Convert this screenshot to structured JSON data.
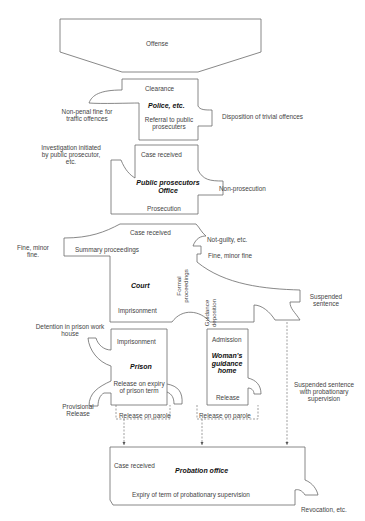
{
  "diagram": {
    "nodes": {
      "offense": {
        "label": "Offense"
      },
      "police": {
        "title": "Police, etc.",
        "top": "Clearance",
        "bottom": "Referral to public prosecuters"
      },
      "prosecutor": {
        "title": "Public prosecutors Office",
        "top": "Case received",
        "bottom": "Prosecution"
      },
      "court": {
        "title": "Court",
        "top": "Case received",
        "summary": "Summary proceedings",
        "formal": "Formal proceedings",
        "guidance": "Guidance deposition",
        "imprisonment": "Imprisonment"
      },
      "prison": {
        "title": "Prison",
        "top": "Imprisonment",
        "bottom": "Release on expiry of prison term"
      },
      "womens_home": {
        "title": "Woman's guidance home",
        "top": "Admission",
        "bottom": "Release"
      },
      "probation": {
        "title": "Probation office",
        "top": "Case received",
        "bottom": "Expiry of term of probationary supervision"
      }
    },
    "outcomes": {
      "non_penal_fine": "Non-penal fine for traffic offences",
      "trivial": "Disposition of trivial offences",
      "investigation": "Investigation initiated by public prosecutor, etc.",
      "non_prosecution": "Non-prosecution",
      "fine_minor_left": "Fine, minor fine.",
      "not_guilty": "Not-guilty, etc.",
      "fine_minor_right": "Fine, minor fine",
      "suspended": "Suspended sentence",
      "detention": "Detention in prison work house",
      "provisional": "Provisional Release",
      "parole_prison": "Release on parole",
      "parole_home": "Release on parole",
      "suspended_probation": "Suspended sentence with probationary supervision",
      "revocation": "Revocation, etc."
    }
  }
}
